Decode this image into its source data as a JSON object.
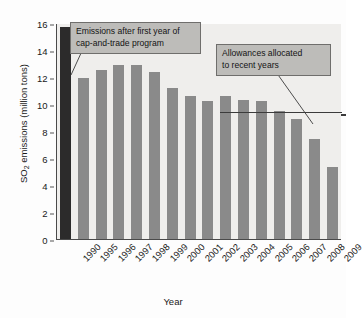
{
  "chart_data": {
    "type": "bar",
    "title": "",
    "xlabel": "Year",
    "ylabel": "SO2 emissions (million tons)",
    "ylabel_parts": {
      "pre": "SO",
      "sub": "2",
      "post": " emissions (million tons)"
    },
    "categories": [
      "1990",
      "1995",
      "1996",
      "1997",
      "1998",
      "1999",
      "2000",
      "2001",
      "2002",
      "2003",
      "2004",
      "2005",
      "2006",
      "2007",
      "2008",
      "2009"
    ],
    "values": [
      15.7,
      11.9,
      12.5,
      12.9,
      12.9,
      12.4,
      11.2,
      10.6,
      10.2,
      10.6,
      10.3,
      10.2,
      9.5,
      8.9,
      7.4,
      5.3
    ],
    "series": [
      {
        "name": "SO2 emissions",
        "values": [
          15.7,
          11.9,
          12.5,
          12.9,
          12.9,
          12.4,
          11.2,
          10.6,
          10.2,
          10.6,
          10.3,
          10.2,
          9.5,
          8.9,
          7.4,
          5.3
        ]
      }
    ],
    "bar_colors": [
      "#2c2b2b",
      "#8a8a8a",
      "#8a8a8a",
      "#8a8a8a",
      "#8a8a8a",
      "#8a8a8a",
      "#8a8a8a",
      "#8a8a8a",
      "#8a8a8a",
      "#8a8a8a",
      "#8a8a8a",
      "#8a8a8a",
      "#8a8a8a",
      "#8a8a8a",
      "#8a8a8a",
      "#8a8a8a"
    ],
    "yticks": [
      0,
      2,
      4,
      6,
      8,
      10,
      12,
      14,
      16
    ],
    "ylim": [
      0,
      16
    ],
    "grid": false,
    "legend": "none",
    "reference_line": {
      "label": "Allowances allocated to recent years",
      "value": 9.3,
      "start_category": "2003"
    },
    "annotations": [
      {
        "id": "note1",
        "text": "Emissions after first year of cap-and-trade program",
        "points_to": "1995"
      },
      {
        "id": "note2",
        "text": "Allowances allocated to recent years",
        "points_to": "allowance-line"
      }
    ],
    "plot_bg": "#efeeec",
    "axis_color": "#4a4a4a"
  },
  "annotations": {
    "note1_line1": "Emissions after first year of",
    "note1_line2": "cap-and-trade program",
    "note2_line1": "Allowances allocated",
    "note2_line2": "to recent years"
  }
}
